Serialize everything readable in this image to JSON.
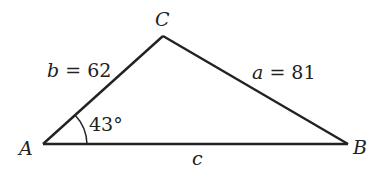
{
  "diagram": {
    "type": "triangle",
    "vertices": {
      "A": {
        "label": "A"
      },
      "B": {
        "label": "B"
      },
      "C": {
        "label": "C"
      }
    },
    "sides": {
      "a": {
        "var": "a",
        "eq": "=",
        "value": "81"
      },
      "b": {
        "var": "b",
        "eq": "=",
        "value": "62"
      },
      "c": {
        "var": "c"
      }
    },
    "angle_A": {
      "text": "43°"
    },
    "colors": {
      "stroke": "#222222",
      "background": "#ffffff"
    }
  }
}
